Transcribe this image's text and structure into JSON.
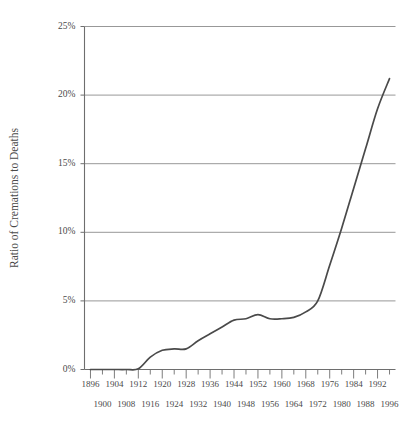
{
  "chart_data": {
    "type": "line",
    "title": "",
    "xlabel": "",
    "ylabel": "Ratio of Cremations to Deaths",
    "xlim": [
      1894,
      1998
    ],
    "ylim": [
      0,
      25
    ],
    "grid": true,
    "legend": null,
    "y_ticks": [
      0,
      5,
      10,
      15,
      20,
      25
    ],
    "y_tick_labels": [
      "0%",
      "5%",
      "10%",
      "15%",
      "20%",
      "25%"
    ],
    "x_ticks_upper": [
      1896,
      1904,
      1912,
      1920,
      1928,
      1936,
      1944,
      1952,
      1960,
      1968,
      1976,
      1984,
      1992
    ],
    "x_tick_labels_upper": [
      "1896",
      "1904",
      "1912",
      "1920",
      "1928",
      "1936",
      "1944",
      "1952",
      "1960",
      "1968",
      "1976",
      "1984",
      "1992"
    ],
    "x_ticks_lower": [
      1900,
      1908,
      1916,
      1924,
      1932,
      1940,
      1948,
      1956,
      1964,
      1972,
      1980,
      1988,
      1996
    ],
    "x_tick_labels_lower": [
      "1900",
      "1908",
      "1916",
      "1924",
      "1932",
      "1940",
      "1948",
      "1956",
      "1964",
      "1972",
      "1980",
      "1988",
      "1996"
    ],
    "line_color": "#4a4a4a",
    "grid_color": "#8c8c8c",
    "axis_color": "#6e6e6e",
    "series": [
      {
        "name": "Ratio of Cremations to Deaths",
        "x": [
          1896,
          1900,
          1904,
          1908,
          1912,
          1916,
          1920,
          1924,
          1928,
          1932,
          1936,
          1940,
          1944,
          1948,
          1952,
          1956,
          1960,
          1964,
          1968,
          1972,
          1976,
          1980,
          1984,
          1988,
          1992,
          1996
        ],
        "values": [
          0.0,
          0.0,
          0.0,
          0.0,
          0.05,
          0.9,
          1.4,
          1.5,
          1.5,
          2.1,
          2.6,
          3.1,
          3.6,
          3.7,
          4.0,
          3.7,
          3.7,
          3.8,
          4.2,
          5.0,
          7.6,
          10.3,
          13.2,
          16.1,
          19.0,
          21.2
        ]
      }
    ]
  },
  "axis_labels": {
    "y_axis_title": "Ratio of Cremations to Deaths"
  }
}
